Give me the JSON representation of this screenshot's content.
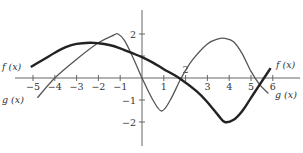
{
  "chart_data": {
    "type": "line",
    "title": "",
    "xlabel": "",
    "ylabel": "",
    "xlim": [
      -5.8,
      6.9
    ],
    "ylim": [
      -3,
      3.1
    ],
    "grid": false,
    "x_ticks": [
      -5,
      -4,
      -3,
      -2,
      -1,
      1,
      2,
      3,
      4,
      5,
      6
    ],
    "x_tick_labels": [
      "−5",
      "−4",
      "−3",
      "−2",
      "−1",
      "1",
      "",
      "3",
      "4",
      "5",
      "6"
    ],
    "y_ticks": [
      2,
      1,
      -1,
      -2
    ],
    "y_tick_labels": [
      "2",
      "",
      "−1",
      "−2"
    ],
    "x_axis_label_2": "2",
    "series": [
      {
        "name": "f (x)",
        "style": "thick",
        "x": [
          -5.1,
          -4.5,
          -4,
          -3.5,
          -3,
          -2.4,
          -2,
          -1.5,
          -1,
          -0.5,
          0,
          0.5,
          1,
          1.7,
          2.5,
          3,
          3.5,
          3.8,
          4.2,
          4.6,
          5,
          5.4,
          5.9
        ],
        "y": [
          0.5,
          0.85,
          1.15,
          1.4,
          1.55,
          1.6,
          1.58,
          1.5,
          1.35,
          1.15,
          0.95,
          0.7,
          0.4,
          0.0,
          -0.6,
          -1.1,
          -1.7,
          -2.0,
          -1.9,
          -1.5,
          -0.9,
          -0.3,
          0.45
        ]
      },
      {
        "name": "g (x)",
        "style": "thin",
        "x": [
          -4.8,
          -4,
          -3,
          -2,
          -1.3,
          -1.1,
          -0.8,
          -0.4,
          0,
          0.5,
          0.9,
          1.3,
          1.8,
          2.3,
          3,
          3.5,
          3.8,
          4.2,
          4.6,
          5,
          5.4,
          5.8
        ],
        "y": [
          -0.9,
          0.0,
          0.85,
          1.6,
          1.95,
          2.0,
          1.7,
          0.9,
          0.0,
          -1.0,
          -1.5,
          -1.0,
          0.0,
          0.8,
          1.55,
          1.78,
          1.8,
          1.65,
          1.1,
          0.3,
          -0.3,
          -0.7
        ]
      }
    ],
    "annotations": [
      {
        "text": "f (x)",
        "position": "left end of f"
      },
      {
        "text": "g (x)",
        "position": "left end of g"
      },
      {
        "text": "f (x)",
        "position": "right end of f"
      },
      {
        "text": "g (x)",
        "position": "right end of g"
      }
    ]
  },
  "labels": {
    "f_left": "f (x)",
    "g_left": "g (x)",
    "f_right": "f (x)",
    "g_right": "g (x)"
  }
}
